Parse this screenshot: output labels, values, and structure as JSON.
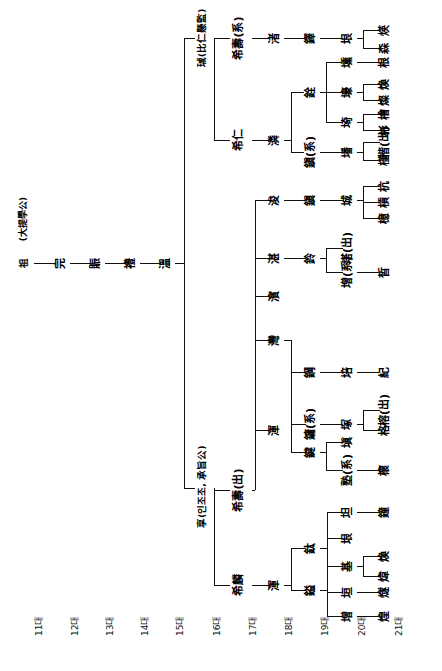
{
  "chart": {
    "title_note": "(大提學公)",
    "generations": [
      "11대",
      "12대",
      "13대",
      "14대",
      "15대",
      "16대",
      "17대",
      "18대",
      "19대",
      "20대",
      "21대"
    ],
    "markers": {
      "adopted_in": "(系)",
      "adopted_out": "(出)"
    },
    "branch_notes": {
      "top": "珹(比仁懸監)",
      "bottom": "享(인조조, 承旨公)"
    },
    "people": {
      "g11": "祖",
      "g12": "完",
      "g13": "賑",
      "g14": "禮",
      "g15": "溫",
      "g16_a": "珹(比仁懸監)",
      "g16_b": "享(인조조, 承旨公)",
      "g17_a": "希壽(系)",
      "g17_b": "希仁",
      "g17_c": "希壽(出)",
      "g17_d": "希麟",
      "g18_a": "渚",
      "g18_b": "浚",
      "g18_c": "潾",
      "g18_d": "湛",
      "g18_e": "濱",
      "g18_f": "灣",
      "g18_g": "渾",
      "g19_a": "鐸",
      "g19_b": "銓",
      "g19_c": "鎭(系)",
      "g19_d": "鎭",
      "g19_e": "鈴",
      "g19_f": "鋼",
      "g19_g": "鏞(系)",
      "g19_h": "鍵",
      "g19_i": "鈦",
      "g19_j": "鎰",
      "g20_a": "垠",
      "g20_b": "壎",
      "g20_c": "壕",
      "g20_d": "埼",
      "g20_e": "墦",
      "g20_f": "城",
      "g20_g": "屋",
      "g20_h": "圭",
      "g20_i": "塼(出)",
      "g20_j": "坤",
      "g20_k": "塔(出)",
      "g20_l": "增(系)",
      "g20_m": "培",
      "g20_n": "塚",
      "g20_o": "塡",
      "g20_p": "塾(系)",
      "g20_q": "坦",
      "g20_r": "垠",
      "g20_s": "基",
      "g20_t": "垣",
      "g20_u": "增",
      "g21_a": "煐",
      "g21_b": "森",
      "g21_c": "根",
      "g21_d": "煥",
      "g21_e": "燦",
      "g21_f": "檜",
      "g21_g": "彬",
      "g21_h": "森",
      "g21_i": "楷(出)",
      "g21_j": "槿",
      "g21_k": "櫟",
      "g21_l": "榮",
      "g21_m": "梯",
      "g21_n": "模(出)",
      "g21_o": "杭",
      "g21_p": "槓",
      "g21_q": "檍",
      "g21_r": "晳",
      "g21_s": "紀",
      "g21_t": "榕(出)",
      "g21_u": "格",
      "g21_v": "櫰",
      "g21_w": "鐘",
      "g21_x": "煥",
      "g21_y": "煒",
      "g21_z": "燧",
      "g21_aa": "煌"
    }
  }
}
